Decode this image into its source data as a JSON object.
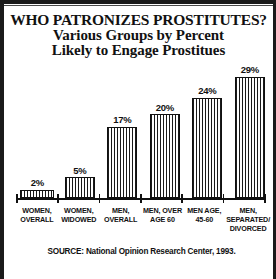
{
  "title": {
    "line1": "WHO PATRONIZES PROSTITUTES?",
    "line2": "Various Groups by Percent",
    "line3": "Likely to Engage Prostitues"
  },
  "source": {
    "text": "SOURCE: National Opinion Research Center, 1993."
  },
  "colors": {
    "frame": "#1a1a1a",
    "ink": "#111111",
    "background": "#ffffff",
    "bar_hatch": "#1a1a1a"
  },
  "chart_data": {
    "type": "bar",
    "title": "WHO PATRONIZES PROSTITUTES? Various Groups by Percent Likely to Engage Prostitues",
    "subtitle": "Various Groups by Percent Likely to Engage Prostitues",
    "xlabel": "",
    "ylabel": "",
    "ylim": [
      0,
      32
    ],
    "grid": false,
    "legend": false,
    "value_labels": true,
    "categories": [
      "WOMEN, OVERALL",
      "WOMEN, WIDOWED",
      "MEN, OVERALL",
      "MEN, OVER AGE 60",
      "MEN AGE, 45-60",
      "MEN, SEPARATED/ DIVORCED"
    ],
    "category_lines": [
      [
        "WOMEN,",
        "OVERALL"
      ],
      [
        "WOMEN,",
        "WIDOWED"
      ],
      [
        "MEN,",
        "OVERALL"
      ],
      [
        "MEN, OVER",
        "AGE 60"
      ],
      [
        "MEN AGE,",
        "45-60"
      ],
      [
        "MEN,",
        "SEPARATED/",
        "DIVORCED"
      ]
    ],
    "values": [
      2,
      5,
      17,
      20,
      24,
      29
    ],
    "value_label_texts": [
      "2%",
      "5%",
      "17%",
      "20%",
      "24%",
      "29%"
    ],
    "units": "percent"
  }
}
